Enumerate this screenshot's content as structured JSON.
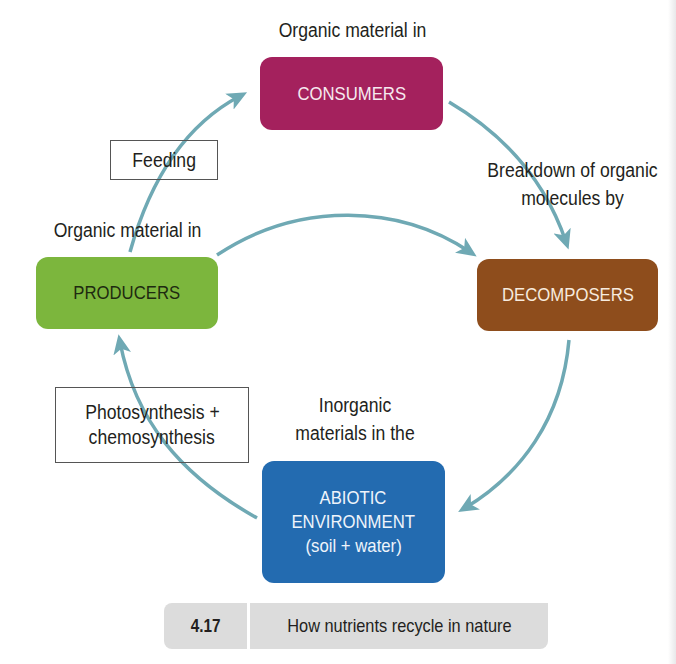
{
  "diagram": {
    "nodes": {
      "consumers": {
        "label": "CONSUMERS",
        "caption": "Organic material in",
        "color": "#a4215d"
      },
      "producers": {
        "label": "PRODUCERS",
        "caption": "Organic material in",
        "color": "#7cb63d"
      },
      "decomposers": {
        "label": "DECOMPOSERS",
        "caption_line1": "Breakdown of organic",
        "caption_line2": "molecules by",
        "color": "#8e4d1c"
      },
      "abiotic": {
        "label_line1": "ABIOTIC",
        "label_line2": "ENVIRONMENT",
        "label_line3": "(soil + water)",
        "caption_line1": "Inorganic",
        "caption_line2": "materials in the",
        "color": "#236bb0"
      }
    },
    "processes": {
      "feeding": "Feeding",
      "photosynthesis_line1": "Photosynthesis +",
      "photosynthesis_line2": "chemosynthesis"
    },
    "edges": [
      {
        "from": "producers",
        "to": "consumers",
        "label": "Feeding"
      },
      {
        "from": "consumers",
        "to": "decomposers"
      },
      {
        "from": "producers",
        "to": "decomposers"
      },
      {
        "from": "decomposers",
        "to": "abiotic"
      },
      {
        "from": "abiotic",
        "to": "producers",
        "label": "Photosynthesis + chemosynthesis"
      }
    ],
    "arrow_color": "#6fa9b4"
  },
  "figure_caption": {
    "number": "4.17",
    "text": "How nutrients recycle in nature"
  }
}
